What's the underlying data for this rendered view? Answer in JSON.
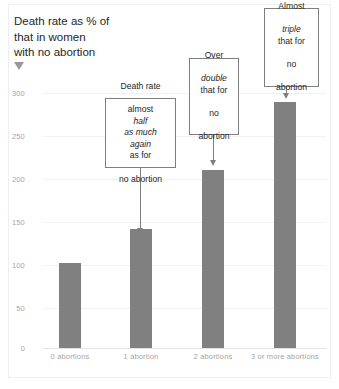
{
  "figure": {
    "axis_title": "Death rate as % of\nthat in women\nwith no abortion",
    "axis_title_marker": "down-triangle"
  },
  "chart_data": {
    "type": "bar",
    "title": "",
    "xlabel": "",
    "ylabel": "Death rate as % of that in women with no abortion",
    "categories": [
      "0 abortions",
      "1 abortion",
      "2 abortions",
      "3 or more abortions"
    ],
    "values": [
      100,
      140,
      210,
      290
    ],
    "ylim": [
      0,
      300
    ],
    "yticks": [
      "0",
      "50",
      "100",
      "150",
      "200",
      "250",
      "300"
    ],
    "ytick_values": [
      0,
      50,
      100,
      150,
      200,
      250,
      300
    ],
    "grid": true,
    "legend": "none",
    "bar_color": "#808080",
    "annotations": [
      {
        "id": "callout-1",
        "target_category": "1 abortion",
        "lines": [
          {
            "text": "Death rate",
            "italic": false
          },
          {
            "text": "almost ",
            "italic": false,
            "italic_tail": "half"
          },
          {
            "text": "as much",
            "italic": true
          },
          {
            "text": "again",
            "italic": true,
            "plain_tail": " as for"
          },
          {
            "text": "no abortion",
            "italic": false
          }
        ],
        "plain_text": "Death rate almost half as much again as for no abortion"
      },
      {
        "id": "callout-2",
        "target_category": "2 abortions",
        "lines": [
          {
            "text": "Over",
            "italic": false
          },
          {
            "text": "double",
            "italic": true
          },
          {
            "text": "that for",
            "italic": false
          },
          {
            "text": "no",
            "italic": false
          },
          {
            "text": "abortion",
            "italic": false
          }
        ],
        "plain_text": "Over double that for no abortion"
      },
      {
        "id": "callout-3",
        "target_category": "3 or more abortions",
        "lines": [
          {
            "text": "Almost",
            "italic": false
          },
          {
            "text": "triple",
            "italic": true
          },
          {
            "text": "that for",
            "italic": false
          },
          {
            "text": "no",
            "italic": false
          },
          {
            "text": "abortion",
            "italic": false
          }
        ],
        "plain_text": "Almost triple that for no abortion"
      }
    ]
  },
  "callouts": {
    "one": {
      "l1": "Death rate",
      "l2a": "almost ",
      "l2b": "half",
      "l3": "as much",
      "l4a": "again",
      "l4b": " as for",
      "l5": "no abortion"
    },
    "two": {
      "l1": "Over",
      "l2": "double",
      "l3": "that for",
      "l4": "no",
      "l5": "abortion"
    },
    "three": {
      "l1": "Almost",
      "l2": "triple",
      "l3": "that for",
      "l4": "no",
      "l5": "abortion"
    }
  }
}
